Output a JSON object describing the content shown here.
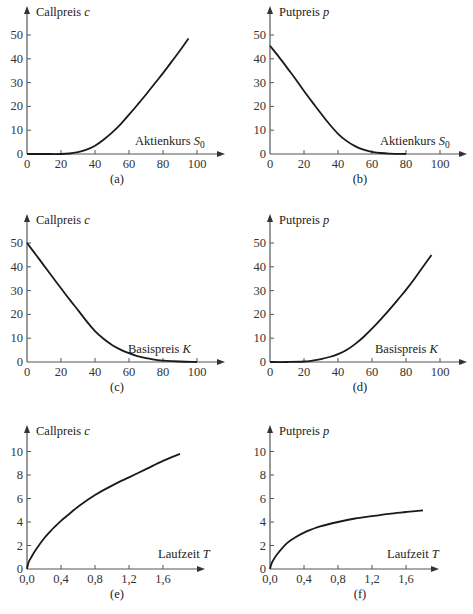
{
  "chart_data": [
    {
      "id": "a",
      "type": "line",
      "caption": "(a)",
      "ylabel": "Callpreis",
      "ylabel_var": "c",
      "xlabel": "Aktienkurs",
      "xlabel_var": "S",
      "xlabel_sub": "0",
      "xticks": [
        0,
        20,
        40,
        60,
        80,
        100
      ],
      "yticks": [
        0,
        10,
        20,
        30,
        40,
        50
      ],
      "xtick_labels": [
        "0",
        "20",
        "40",
        "60",
        "80",
        "100"
      ],
      "ytick_labels": [
        "0",
        "10",
        "20",
        "30",
        "40",
        "50"
      ],
      "xlim": [
        0,
        110
      ],
      "ylim": [
        0,
        55
      ],
      "x": [
        0,
        10,
        20,
        25,
        30,
        35,
        40,
        45,
        50,
        55,
        60,
        65,
        70,
        75,
        80,
        85,
        90,
        95
      ],
      "y": [
        0,
        0,
        0,
        0.2,
        0.8,
        1.8,
        3.5,
        6,
        9,
        12.5,
        16.5,
        20.7,
        25,
        29.5,
        34,
        38.7,
        43.5,
        48.5
      ]
    },
    {
      "id": "b",
      "type": "line",
      "caption": "(b)",
      "ylabel": "Putpreis",
      "ylabel_var": "p",
      "xlabel": "Aktienkurs",
      "xlabel_var": "S",
      "xlabel_sub": "0",
      "xticks": [
        0,
        20,
        40,
        60,
        80,
        100
      ],
      "yticks": [
        0,
        10,
        20,
        30,
        40,
        50
      ],
      "xtick_labels": [
        "0",
        "20",
        "40",
        "60",
        "80",
        "100"
      ],
      "ytick_labels": [
        "0",
        "10",
        "20",
        "30",
        "40",
        "50"
      ],
      "xlim": [
        0,
        110
      ],
      "ylim": [
        0,
        55
      ],
      "x": [
        0,
        5,
        10,
        15,
        20,
        25,
        30,
        35,
        40,
        45,
        50,
        55,
        60,
        65,
        70,
        75,
        80
      ],
      "y": [
        45.5,
        41,
        36.3,
        31.5,
        26.5,
        21.7,
        17,
        12.5,
        8.5,
        5.5,
        3.3,
        1.8,
        0.9,
        0.4,
        0.15,
        0.05,
        0
      ]
    },
    {
      "id": "c",
      "type": "line",
      "caption": "(c)",
      "ylabel": "Callpreis",
      "ylabel_var": "c",
      "xlabel": "Basispreis",
      "xlabel_var": "K",
      "xlabel_sub": "",
      "xticks": [
        0,
        20,
        40,
        60,
        80,
        100
      ],
      "yticks": [
        0,
        10,
        20,
        30,
        40,
        50
      ],
      "xtick_labels": [
        "0",
        "20",
        "40",
        "60",
        "80",
        "100"
      ],
      "ytick_labels": [
        "0",
        "10",
        "20",
        "30",
        "40",
        "50"
      ],
      "xlim": [
        0,
        110
      ],
      "ylim": [
        0,
        55
      ],
      "x": [
        0,
        5,
        10,
        15,
        20,
        25,
        30,
        35,
        40,
        45,
        50,
        55,
        60,
        65,
        70,
        75,
        80,
        90,
        100
      ],
      "y": [
        50,
        45.3,
        40.5,
        35.7,
        31,
        26.3,
        21.8,
        17.2,
        13,
        9.8,
        7.2,
        5.2,
        3.7,
        2.5,
        1.6,
        1,
        0.6,
        0.2,
        0
      ]
    },
    {
      "id": "d",
      "type": "line",
      "caption": "(d)",
      "ylabel": "Putpreis",
      "ylabel_var": "p",
      "xlabel": "Basispreis",
      "xlabel_var": "K",
      "xlabel_sub": "",
      "xticks": [
        0,
        20,
        40,
        60,
        80,
        100
      ],
      "yticks": [
        0,
        10,
        20,
        30,
        40,
        50
      ],
      "xtick_labels": [
        "0",
        "20",
        "40",
        "60",
        "80",
        "100"
      ],
      "ytick_labels": [
        "0",
        "10",
        "20",
        "30",
        "40",
        "50"
      ],
      "xlim": [
        0,
        110
      ],
      "ylim": [
        0,
        55
      ],
      "x": [
        0,
        10,
        20,
        25,
        30,
        35,
        40,
        45,
        50,
        55,
        60,
        65,
        70,
        75,
        80,
        85,
        90,
        95
      ],
      "y": [
        0,
        0,
        0.2,
        0.6,
        1.2,
        2.1,
        3.3,
        5,
        7.5,
        10.5,
        14,
        17.8,
        21.8,
        26,
        30.3,
        35,
        40,
        45
      ]
    },
    {
      "id": "e",
      "type": "line",
      "caption": "(e)",
      "ylabel": "Callpreis",
      "ylabel_var": "c",
      "xlabel": "Laufzeit",
      "xlabel_var": "T",
      "xlabel_sub": "",
      "xticks": [
        0,
        0.4,
        0.8,
        1.2,
        1.6
      ],
      "yticks": [
        0,
        2,
        4,
        6,
        8,
        10
      ],
      "xtick_labels": [
        "0,0",
        "0,4",
        "0,8",
        "1,2",
        "1,6"
      ],
      "ytick_labels": [
        "0",
        "2",
        "4",
        "6",
        "8",
        "10"
      ],
      "xlim": [
        0,
        1.95
      ],
      "ylim": [
        0,
        11.5
      ],
      "x": [
        0,
        0.02,
        0.05,
        0.1,
        0.2,
        0.3,
        0.4,
        0.5,
        0.6,
        0.8,
        1.0,
        1.2,
        1.4,
        1.6,
        1.8
      ],
      "y": [
        0,
        0.6,
        1.0,
        1.6,
        2.6,
        3.4,
        4.1,
        4.7,
        5.3,
        6.3,
        7.1,
        7.8,
        8.5,
        9.2,
        9.8
      ]
    },
    {
      "id": "f",
      "type": "line",
      "caption": "(f)",
      "ylabel": "Putpreis",
      "ylabel_var": "p",
      "xlabel": "Laufzeit",
      "xlabel_var": "T",
      "xlabel_sub": "",
      "xticks": [
        0,
        0.4,
        0.8,
        1.2,
        1.6
      ],
      "yticks": [
        0,
        2,
        4,
        6,
        8,
        10
      ],
      "xtick_labels": [
        "0,0",
        "0,4",
        "0,8",
        "1,2",
        "1,6"
      ],
      "ytick_labels": [
        "0",
        "2",
        "4",
        "6",
        "8",
        "10"
      ],
      "xlim": [
        0,
        1.95
      ],
      "ylim": [
        0,
        11.5
      ],
      "x": [
        0,
        0.02,
        0.05,
        0.1,
        0.2,
        0.3,
        0.4,
        0.5,
        0.6,
        0.8,
        1.0,
        1.2,
        1.4,
        1.6,
        1.8
      ],
      "y": [
        0,
        0.5,
        0.9,
        1.4,
        2.2,
        2.7,
        3.1,
        3.4,
        3.65,
        4.0,
        4.3,
        4.5,
        4.7,
        4.85,
        5.0
      ]
    }
  ]
}
